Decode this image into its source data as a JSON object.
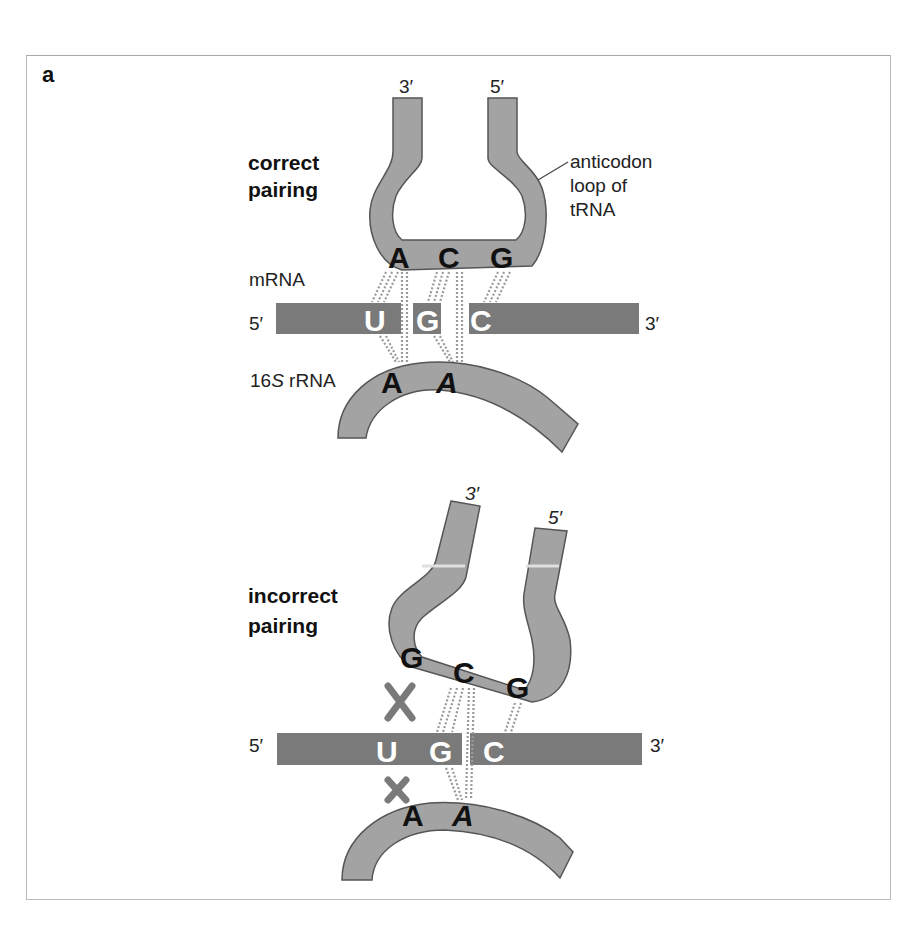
{
  "figure": {
    "panel_label": "a",
    "colors": {
      "strand_fill": "#a3a3a3",
      "strand_outline": "#555555",
      "mrna_fill": "#7a7a7a",
      "hbond": "#9a9a9a",
      "x_mark": "#7a7a7a",
      "border": "#b9b9b9"
    }
  },
  "top": {
    "title_line1": "correct",
    "title_line2": "pairing",
    "trna_end_left": "3′",
    "trna_end_right": "5′",
    "annotation_line1": "anticodon",
    "annotation_line2": "loop of",
    "annotation_line3": "tRNA",
    "anticodon": [
      "A",
      "C",
      "G"
    ],
    "mrna_label": "mRNA",
    "mrna_end_left": "5′",
    "mrna_end_right": "3′",
    "codon": [
      "U",
      "G",
      "C"
    ],
    "rrna_label_prefix": "16",
    "rrna_label_italic": "S",
    "rrna_label_suffix": " rRNA",
    "rrna_bases": [
      "A",
      "A"
    ]
  },
  "bottom": {
    "title_line1": "incorrect",
    "title_line2": "pairing",
    "trna_end_left": "3′",
    "trna_end_right": "5′",
    "anticodon": [
      "G",
      "C",
      "G"
    ],
    "mrna_end_left": "5′",
    "mrna_end_right": "3′",
    "codon": [
      "U",
      "G",
      "C"
    ],
    "rrna_bases": [
      "A",
      "A"
    ],
    "mismatch_marks": [
      "X",
      "X"
    ]
  }
}
